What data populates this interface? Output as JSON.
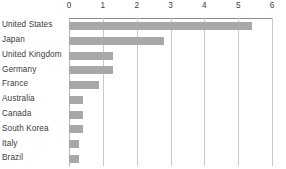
{
  "chart_data": {
    "type": "bar",
    "orientation": "horizontal",
    "title": "",
    "subtitle": "",
    "xlabel": "",
    "ylabel": "",
    "xlim": [
      0,
      6
    ],
    "grid": true,
    "legend": false,
    "legend_position": "none",
    "axis_position": "top",
    "xticks": [
      0,
      1,
      2,
      3,
      4,
      5,
      6
    ],
    "xtick_labels": [
      "0",
      "1",
      "2",
      "3",
      "4",
      "5",
      "6"
    ],
    "categories": [
      "United States",
      "Japan",
      "United Kingdom",
      "Germany",
      "France",
      "Australia",
      "Canada",
      "South Korea",
      "Italy",
      "Brazil"
    ],
    "values": [
      5.4,
      2.8,
      1.3,
      1.3,
      0.9,
      0.4,
      0.4,
      0.4,
      0.3,
      0.3
    ],
    "series": [
      {
        "name": "",
        "values": [
          5.4,
          2.8,
          1.3,
          1.3,
          0.9,
          0.4,
          0.4,
          0.4,
          0.3,
          0.3
        ]
      }
    ]
  },
  "style": {
    "bar_color": "#a8a8a8",
    "gridline_color": "#c9c9c9",
    "axis_color": "#8c8c8c",
    "text_color": "#3b3b3b",
    "background": "#ffffff"
  }
}
